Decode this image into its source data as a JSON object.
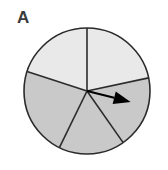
{
  "figure": {
    "panel_label": "A",
    "kind": "spinner-wheel-diagram",
    "background_color": "#ffffff"
  },
  "spinner": {
    "center_x": 87,
    "center_y": 91,
    "radius": 63,
    "outline_color": "#2b2b2b",
    "outline_width": 1.6,
    "divider_color": "#2b2b2b",
    "divider_width": 1.6,
    "sector_count": 5,
    "light_fill": "#e9e9e9",
    "dark_fill": "#c9c9c9",
    "sectors": [
      {
        "name": "sector-top-left",
        "start_angle_deg": 90,
        "end_angle_deg": 162,
        "fill": "#e9e9e9",
        "shade": "light"
      },
      {
        "name": "sector-left",
        "start_angle_deg": 162,
        "end_angle_deg": 244,
        "fill": "#c9c9c9",
        "shade": "dark"
      },
      {
        "name": "sector-bottom",
        "start_angle_deg": 244,
        "end_angle_deg": 305,
        "fill": "#c9c9c9",
        "shade": "dark"
      },
      {
        "name": "sector-right",
        "start_angle_deg": 305,
        "end_angle_deg": 372,
        "fill": "#c9c9c9",
        "shade": "dark"
      },
      {
        "name": "sector-top-right",
        "start_angle_deg": 12,
        "end_angle_deg": 90,
        "fill": "#e9e9e9",
        "shade": "light"
      }
    ],
    "dividers": [
      {
        "name": "divider-up",
        "angle_deg": 90
      },
      {
        "name": "divider-upper-left",
        "angle_deg": 162
      },
      {
        "name": "divider-lower-left",
        "angle_deg": 244
      },
      {
        "name": "divider-lower-right",
        "angle_deg": 305
      },
      {
        "name": "divider-upper-right",
        "angle_deg": 12
      }
    ],
    "pointer": {
      "name": "spinner-arrow",
      "angle_deg": -14,
      "length": 45,
      "color": "#000000",
      "shaft_width": 2.2,
      "head_length": 17,
      "head_width": 13
    }
  }
}
